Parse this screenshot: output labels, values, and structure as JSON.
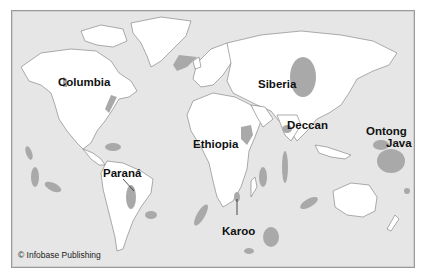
{
  "map": {
    "title": "Large igneous provinces of the world",
    "colors": {
      "ocean": "#e6e6e6",
      "land": "#ffffff",
      "province": "#a9a9a9",
      "coastline": "#777777",
      "frame": "#9a9a9a"
    },
    "labels": [
      {
        "id": "columbia",
        "text": "Columbia"
      },
      {
        "id": "siberia",
        "text": "Siberia"
      },
      {
        "id": "deccan",
        "text": "Deccan"
      },
      {
        "id": "ethiopia",
        "text": "Ethiopia"
      },
      {
        "id": "ontong",
        "text": "Ontong"
      },
      {
        "id": "java",
        "text": "Java"
      },
      {
        "id": "parana",
        "text": "Paraná"
      },
      {
        "id": "karoo",
        "text": "Karoo"
      }
    ],
    "credit": "© Infobase Publishing"
  }
}
